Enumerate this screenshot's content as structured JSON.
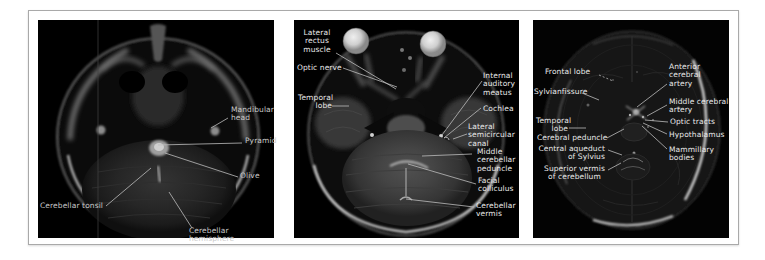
{
  "figure": {
    "type": "labeled-axial-mri-triptych",
    "colors": {
      "background": "#ffffff",
      "frame_border": "#a9a9a9",
      "panel_background": "#000000",
      "label_text_panel1": "#c9c9c9",
      "label_text_panels23": "#e9e9e9",
      "leader_line": "#bdbdbd"
    }
  },
  "panels": [
    {
      "labels": [
        {
          "id": "mandibular-head",
          "text": "Mandibular\nhead"
        },
        {
          "id": "pyramid",
          "text": "Pyramid"
        },
        {
          "id": "olive",
          "text": "Olive"
        },
        {
          "id": "cerebellar-tonsil",
          "text": "Cerebellar tonsil"
        },
        {
          "id": "cerebellar-hemisphere",
          "text": "Cerebellar hemisphere"
        }
      ]
    },
    {
      "labels": [
        {
          "id": "lateral-rectus-muscle",
          "text": "Lateral\nrectus\nmuscle"
        },
        {
          "id": "optic-nerve",
          "text": "Optic nerve"
        },
        {
          "id": "temporal-lobe",
          "text": "Temporal\nlobe"
        },
        {
          "id": "internal-auditory-meatus",
          "text": "Internal\nauditory\nmeatus"
        },
        {
          "id": "cochlea",
          "text": "Cochlea"
        },
        {
          "id": "lateral-semicircular-canal",
          "text": "Lateral\nsemicircular\ncanal"
        },
        {
          "id": "middle-cerebellar-peduncle",
          "text": "Middle\ncerebellar\npeduncle"
        },
        {
          "id": "facial-colliculus",
          "text": "Facial\ncolliculus"
        },
        {
          "id": "cerebellar-vermis",
          "text": "Cerebellar\nvermis"
        }
      ]
    },
    {
      "labels": [
        {
          "id": "frontal-lobe",
          "text": "Frontal lobe"
        },
        {
          "id": "sylvian-fissure",
          "text": "Sylvianfissure"
        },
        {
          "id": "temporal-lobe",
          "text": "Temporal\nlobe"
        },
        {
          "id": "cerebral-peduncle",
          "text": "Cerebral peduncle"
        },
        {
          "id": "central-aqueduct-of-sylvius",
          "text": "Central aqueduct\nof Sylvius"
        },
        {
          "id": "superior-vermis-of-cerebellum",
          "text": "Superior vermis\nof cerebellum"
        },
        {
          "id": "anterior-cerebral-artery",
          "text": "Anterior\ncerebral\nartery"
        },
        {
          "id": "middle-cerebral-artery",
          "text": "Middle cerebral\nartery"
        },
        {
          "id": "optic-tracts",
          "text": "Optic tracts"
        },
        {
          "id": "hypothalamus",
          "text": "Hypothalamus"
        },
        {
          "id": "mammillary-bodies",
          "text": "Mammillary\nbodies"
        }
      ]
    }
  ]
}
